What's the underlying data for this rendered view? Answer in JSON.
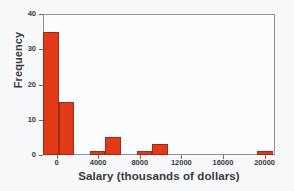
{
  "chart_data": {
    "type": "bar",
    "title": "",
    "subtitle": "",
    "xlabel": "Salary (thousands of dollars)",
    "ylabel": "Frequency",
    "xlim": [
      -1300,
      21000
    ],
    "ylim": [
      0,
      40
    ],
    "grid": false,
    "legend": null,
    "bar_color": "#e03a18",
    "bar_edge_color": "#a32a12",
    "frame_color": "#8e9197",
    "bin_width": 1500,
    "x_ticks": [
      0,
      4000,
      8000,
      12000,
      16000,
      20000
    ],
    "x_tick_labels": [
      "0",
      "4000",
      "8000",
      "12000",
      "16000",
      "20000"
    ],
    "y_ticks": [
      0,
      10,
      20,
      30,
      40
    ],
    "y_tick_labels": [
      "0",
      "10",
      "20",
      "30",
      "40"
    ],
    "bins": [
      {
        "start": -1300,
        "end": 200,
        "value": 35
      },
      {
        "start": 200,
        "end": 1700,
        "value": 15
      },
      {
        "start": 1700,
        "end": 3200,
        "value": 0
      },
      {
        "start": 3200,
        "end": 4700,
        "value": 1
      },
      {
        "start": 4700,
        "end": 6200,
        "value": 5
      },
      {
        "start": 6200,
        "end": 7700,
        "value": 0
      },
      {
        "start": 7700,
        "end": 9200,
        "value": 1
      },
      {
        "start": 9200,
        "end": 10700,
        "value": 3
      },
      {
        "start": 10700,
        "end": 19300,
        "value": 0
      },
      {
        "start": 19300,
        "end": 20800,
        "value": 1
      }
    ],
    "categories": [
      "-1300",
      "200",
      "1700",
      "3200",
      "4700",
      "6200",
      "7700",
      "9200",
      "10700",
      "19300"
    ],
    "values": [
      35,
      15,
      0,
      1,
      5,
      0,
      1,
      3,
      0,
      1
    ]
  }
}
